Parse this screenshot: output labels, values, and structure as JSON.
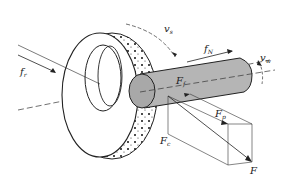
{
  "diagram": {
    "labels": {
      "fr": {
        "main": "f",
        "sub": "r"
      },
      "vs": {
        "main": "v",
        "sub": "s"
      },
      "fN": {
        "main": "f",
        "sub": "N"
      },
      "vw": {
        "main": "v",
        "sub": "w"
      },
      "Ff": {
        "main": "F",
        "sub": "f"
      },
      "Fp": {
        "main": "F",
        "sub": "p"
      },
      "Fc": {
        "main": "F",
        "sub": "c"
      },
      "F": {
        "main": "F",
        "sub": ""
      }
    },
    "colors": {
      "line": "#222222",
      "workpiece": "#b5b5b5",
      "workpiece_end": "#a8a8a8",
      "background": "#ffffff"
    }
  }
}
